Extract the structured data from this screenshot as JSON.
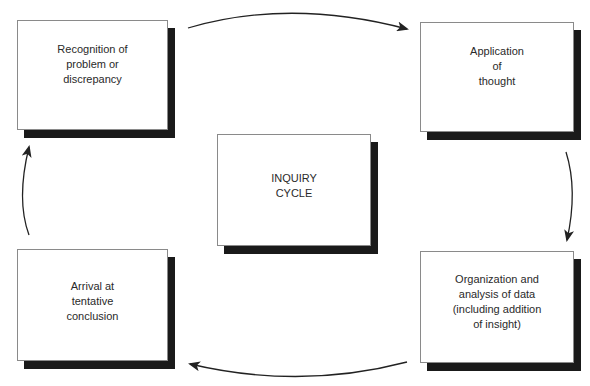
{
  "diagram": {
    "type": "cycle",
    "center": {
      "label": "INQUIRY\nCYCLE"
    },
    "nodes": [
      {
        "id": "recognition",
        "label": "Recognition of\nproblem or\ndiscrepancy"
      },
      {
        "id": "application",
        "label": "Application\nof\nthought"
      },
      {
        "id": "organization",
        "label": "Organization and\nanalysis of data\n(including addition\nof insight)"
      },
      {
        "id": "arrival",
        "label": "Arrival at\ntentative\nconclusion"
      }
    ],
    "edges": [
      {
        "from": "recognition",
        "to": "application"
      },
      {
        "from": "application",
        "to": "organization"
      },
      {
        "from": "organization",
        "to": "arrival"
      },
      {
        "from": "arrival",
        "to": "recognition"
      }
    ],
    "colors": {
      "shadow": "#1a1a1a",
      "border": "#8a8a8a",
      "arrow": "#222222",
      "text": "#2a2a2a"
    }
  }
}
